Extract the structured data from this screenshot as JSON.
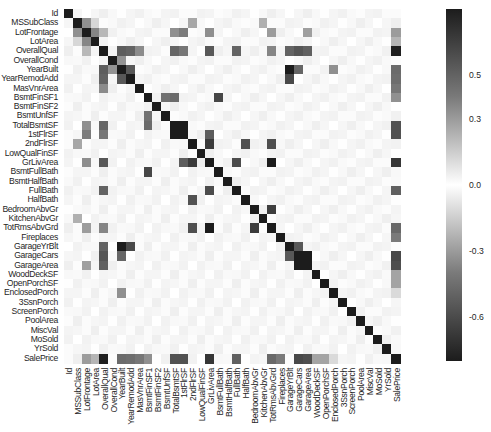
{
  "chart_data": {
    "type": "heatmap",
    "title": "",
    "xlabel": "",
    "ylabel": "",
    "labels": [
      "Id",
      "MSSubClass",
      "LotFrontage",
      "LotArea",
      "OverallQual",
      "OverallCond",
      "YearBuilt",
      "YearRemodAdd",
      "MasVnrArea",
      "BsmtFinSF1",
      "BsmtFinSF2",
      "BsmtUnfSF",
      "TotalBsmtSF",
      "1stFlrSF",
      "2ndFlrSF",
      "LowQualFinSF",
      "GrLivArea",
      "BsmtFullBath",
      "BsmtHalfBath",
      "FullBath",
      "HalfBath",
      "BedroomAbvGr",
      "KitchenAbvGr",
      "TotRmsAbvGrd",
      "Fireplaces",
      "GarageYrBlt",
      "GarageCars",
      "GarageArea",
      "WoodDeckSF",
      "OpenPorchSF",
      "EnclosedPorch",
      "3SsnPorch",
      "ScreenPorch",
      "PoolArea",
      "MiscVal",
      "MoSold",
      "YrSold",
      "SalePrice"
    ],
    "colorbar": {
      "ticks": [
        "0.5",
        "0.3",
        "0.0",
        "-0.3",
        "-0.6"
      ],
      "tick_values": [
        0.5,
        0.3,
        0.0,
        -0.3,
        -0.6
      ],
      "vmin": -0.8,
      "vmax": 0.8,
      "colormap": "diverging black-white-black"
    },
    "values_upper_key_pairs": {
      "MSSubClass|LotFrontage": -0.39,
      "MSSubClass|LotArea": -0.14,
      "MSSubClass|2ndFlrSF": 0.31,
      "MSSubClass|KitchenAbvGr": 0.28,
      "MSSubClass|BedroomAbvGr": -0.02,
      "LotFrontage|LotArea": 0.43,
      "LotFrontage|OverallQual": 0.25,
      "LotFrontage|TotalBsmtSF": 0.39,
      "LotFrontage|1stFlrSF": 0.46,
      "LotFrontage|GrLivArea": 0.4,
      "LotFrontage|TotRmsAbvGrd": 0.35,
      "LotFrontage|GarageArea": 0.34,
      "LotFrontage|SalePrice": 0.35,
      "LotArea|SalePrice": 0.26,
      "OverallQual|YearBuilt": 0.57,
      "OverallQual|YearRemodAdd": 0.55,
      "OverallQual|MasVnrArea": 0.41,
      "OverallQual|TotalBsmtSF": 0.54,
      "OverallQual|1stFlrSF": 0.48,
      "OverallQual|GrLivArea": 0.59,
      "OverallQual|FullBath": 0.55,
      "OverallQual|TotRmsAbvGrd": 0.43,
      "OverallQual|GarageYrBlt": 0.55,
      "OverallQual|GarageCars": 0.6,
      "OverallQual|GarageArea": 0.56,
      "OverallQual|SalePrice": 0.79,
      "OverallCond|YearBuilt": -0.38,
      "YearBuilt|YearRemodAdd": 0.59,
      "YearBuilt|GarageYrBlt": 0.83,
      "YearBuilt|GarageCars": 0.54,
      "YearBuilt|EnclosedPorch": -0.39,
      "YearBuilt|SalePrice": 0.52,
      "YearRemodAdd|GarageYrBlt": 0.64,
      "YearRemodAdd|SalePrice": 0.51,
      "MasVnrArea|SalePrice": 0.48,
      "BsmtFinSF1|BsmtUnfSF": -0.5,
      "BsmtFinSF1|TotalBsmtSF": 0.52,
      "BsmtFinSF1|BsmtFullBath": 0.65,
      "BsmtFinSF1|SalePrice": 0.39,
      "TotalBsmtSF|1stFlrSF": 0.82,
      "TotalBsmtSF|SalePrice": 0.61,
      "1stFlrSF|GrLivArea": 0.57,
      "1stFlrSF|SalePrice": 0.61,
      "2ndFlrSF|GrLivArea": 0.69,
      "2ndFlrSF|HalfBath": 0.61,
      "2ndFlrSF|TotRmsAbvGrd": 0.62,
      "GrLivArea|FullBath": 0.63,
      "GrLivArea|TotRmsAbvGrd": 0.83,
      "GrLivArea|SalePrice": 0.71,
      "FullBath|SalePrice": 0.56,
      "BedroomAbvGr|TotRmsAbvGrd": 0.68,
      "TotRmsAbvGrd|SalePrice": 0.53,
      "Fireplaces|SalePrice": 0.47,
      "GarageYrBlt|GarageCars": 0.59,
      "GarageCars|GarageArea": 0.88,
      "GarageCars|SalePrice": 0.64,
      "GarageArea|SalePrice": 0.62,
      "WoodDeckSF|SalePrice": 0.32,
      "OpenPorchSF|SalePrice": 0.32,
      "EnclosedPorch|SalePrice": -0.13
    },
    "grid": false,
    "legend_position": "right colorbar"
  }
}
